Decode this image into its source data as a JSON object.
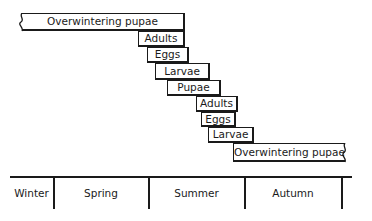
{
  "diagram": {
    "stages": [
      {
        "label": "Overwintering pupae",
        "x": 22,
        "y": 13,
        "w": 163,
        "h": 18,
        "edge": "wavy-left"
      },
      {
        "label": "Adults",
        "x": 138,
        "y": 31,
        "w": 47,
        "h": 16
      },
      {
        "label": "Eggs",
        "x": 147,
        "y": 47,
        "w": 42,
        "h": 16
      },
      {
        "label": "Larvae",
        "x": 155,
        "y": 63,
        "w": 55,
        "h": 17
      },
      {
        "label": "Pupae",
        "x": 167,
        "y": 80,
        "w": 54,
        "h": 16
      },
      {
        "label": "Adults",
        "x": 196,
        "y": 96,
        "w": 42,
        "h": 16
      },
      {
        "label": "Eggs",
        "x": 201,
        "y": 112,
        "w": 35,
        "h": 15
      },
      {
        "label": "Larvae",
        "x": 208,
        "y": 127,
        "w": 46,
        "h": 16
      },
      {
        "label": "Overwintering pupae",
        "x": 233,
        "y": 143,
        "w": 112,
        "h": 19,
        "edge": "wavy-right"
      }
    ],
    "timeline": {
      "seasons": [
        {
          "label": "Winter",
          "x": 10,
          "w": 43
        },
        {
          "label": "Spring",
          "x": 54,
          "w": 94
        },
        {
          "label": "Summer",
          "x": 149,
          "w": 95
        },
        {
          "label": "Autumn",
          "x": 245,
          "w": 96
        }
      ],
      "dividers": [
        53,
        148,
        244,
        341
      ]
    }
  }
}
